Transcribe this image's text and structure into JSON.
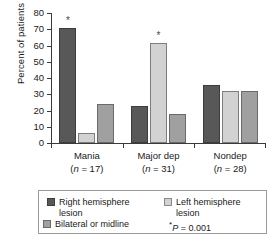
{
  "chart_data": {
    "type": "bar",
    "title": "",
    "xlabel": "",
    "ylabel": "Percent of patients",
    "ylim": [
      0,
      80
    ],
    "yticks": [
      0,
      10,
      20,
      30,
      40,
      50,
      60,
      70,
      80
    ],
    "grid": false,
    "legend_position": "bottom",
    "categories": [
      "Mania",
      "Major dep",
      "Nondep"
    ],
    "category_sublabels": [
      "(n = 17)",
      "(n = 31)",
      "(n = 28)"
    ],
    "category_n": [
      17,
      31,
      28
    ],
    "series": [
      {
        "name": "Right hemisphere lesion",
        "color": "#585858",
        "values": [
          71,
          23,
          36
        ]
      },
      {
        "name": "Left hemisphere lesion",
        "color": "#d2d2d2",
        "values": [
          6,
          61.5,
          32
        ]
      },
      {
        "name": "Bilateral or midline",
        "color": "#a0a0a0",
        "values": [
          24,
          18,
          32
        ]
      }
    ],
    "annotations": [
      {
        "symbol": "*",
        "category": "Mania",
        "series": "Right hemisphere lesion"
      },
      {
        "symbol": "*",
        "category": "Major dep",
        "series": "Left hemisphere lesion"
      }
    ],
    "significance_note": "P = 0.001"
  },
  "axis": {
    "y_title": "Percent of patients",
    "y_tick_labels": [
      "80",
      "70",
      "60",
      "50",
      "40",
      "30",
      "20",
      "10",
      "0"
    ]
  },
  "x_categories": [
    {
      "label": "Mania",
      "sub": "(n = 17)",
      "n_italic": "n",
      "n_rest": " = 17"
    },
    {
      "label": "Major dep",
      "sub": "(n = 31)",
      "n_italic": "n",
      "n_rest": " = 31"
    },
    {
      "label": "Nondep",
      "sub": "(n = 28)",
      "n_italic": "n",
      "n_rest": " = 28"
    }
  ],
  "legend": {
    "items": [
      {
        "label_line1": "Right hemisphere",
        "label_line2": "lesion",
        "swatch": "right-hemisphere-swatch"
      },
      {
        "label_line1": "Left hemisphere",
        "label_line2": "lesion",
        "swatch": "left-hemisphere-swatch"
      },
      {
        "label_line1": "Bilateral or midline",
        "label_line2": "",
        "swatch": "bilateral-swatch"
      }
    ],
    "p_star": "*",
    "p_italic": "P",
    "p_value": " = 0.001"
  },
  "colors": {
    "right_hemisphere": "#585858",
    "left_hemisphere": "#d2d2d2",
    "bilateral": "#a0a0a0",
    "axis": "#3a3a3a",
    "legend_border": "#9a9a9a",
    "background": "#ffffff"
  }
}
